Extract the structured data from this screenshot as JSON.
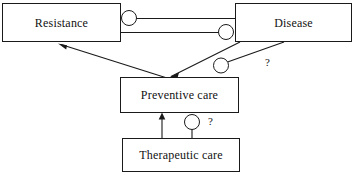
{
  "diagram": {
    "type": "causal-loop-diagram",
    "canvas": {
      "width": 355,
      "height": 175
    },
    "colors": {
      "background": "#ffffff",
      "stroke": "#1a1a1a",
      "text": "#111111",
      "node_fill": "#ffffff"
    },
    "nodes": [
      {
        "id": "resistance",
        "label": "Resistance",
        "x": 2,
        "y": 3,
        "width": 119,
        "height": 39
      },
      {
        "id": "disease",
        "label": "Disease",
        "x": 235,
        "y": 3,
        "width": 117,
        "height": 39
      },
      {
        "id": "preventive_care",
        "label": "Preventive care",
        "x": 120,
        "y": 77,
        "width": 119,
        "height": 36
      },
      {
        "id": "therapeutic_care",
        "label": "Therapeutic care",
        "x": 122,
        "y": 138,
        "width": 118,
        "height": 34
      }
    ],
    "edges": [
      {
        "id": "disease-to-resistance",
        "from": "disease",
        "to": "resistance",
        "endpoint": "circle",
        "endpoint_at": "resistance",
        "path": "M 136 18 L 235 18",
        "circle": {
          "cx": 129,
          "cy": 18,
          "r": 7
        },
        "label": ""
      },
      {
        "id": "resistance-to-disease",
        "from": "resistance",
        "to": "disease",
        "endpoint": "circle",
        "endpoint_at": "disease",
        "path": "M 121 32 L 219 32",
        "circle": {
          "cx": 226,
          "cy": 32,
          "r": 7
        },
        "label": ""
      },
      {
        "id": "preventive-to-resistance",
        "from": "preventive_care",
        "to": "resistance",
        "endpoint": "arrow",
        "endpoint_at": "resistance",
        "path": "M 166 77 L 60 44",
        "label": ""
      },
      {
        "id": "disease-to-preventive",
        "from": "disease",
        "to": "preventive_care",
        "endpoint": "arrow",
        "endpoint_at": "preventive_care",
        "path": "M 239 42 L 170 77",
        "label": ""
      },
      {
        "id": "preventive-to-disease-uncertain",
        "from": "preventive_care",
        "to": "disease",
        "endpoint": "circle",
        "endpoint_at": "preventive_care",
        "path": "M 227 62 L 283 42",
        "circle": {
          "cx": 221,
          "cy": 65,
          "r": 7
        },
        "label": "?"
      },
      {
        "id": "therapeutic-to-preventive",
        "from": "therapeutic_care",
        "to": "preventive_care",
        "endpoint": "arrow",
        "endpoint_at": "preventive_care",
        "path": "M 162 138 L 162 114",
        "label": ""
      },
      {
        "id": "therapeutic-to-preventive-uncertain",
        "from": "therapeutic_care",
        "to": "preventive_care",
        "endpoint": "circle",
        "endpoint_at": "preventive_care",
        "path": "M 192 138 L 192 129",
        "circle": {
          "cx": 192,
          "cy": 122,
          "r": 7
        },
        "label": "?"
      }
    ],
    "annotations": [
      {
        "id": "qmark-disease-preventive",
        "text": "?",
        "x": 265,
        "y": 58
      },
      {
        "id": "qmark-therapeutic-preventive",
        "text": "?",
        "x": 208,
        "y": 117
      }
    ]
  }
}
